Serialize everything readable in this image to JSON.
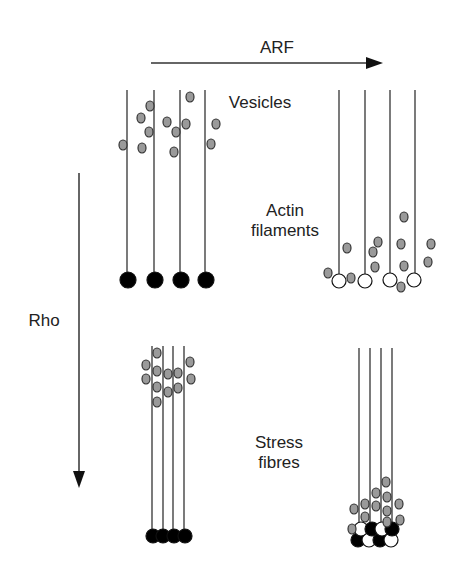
{
  "labels": {
    "arf": "ARF",
    "rho": "Rho",
    "vesicles": "Vesicles",
    "actin_line1": "Actin",
    "actin_line2": "filaments",
    "stress_line1": "Stress",
    "stress_line2": "fibres"
  },
  "colors": {
    "line": "#333333",
    "vesicle_fill": "#9a9a9a",
    "vesicle_stroke": "#333333",
    "ball_black": "#000000",
    "ball_white": "#ffffff",
    "text": "#222222"
  },
  "arrows": {
    "arf": {
      "x1": 151,
      "y1": 63,
      "x2": 383,
      "y2": 63,
      "direction": "right"
    },
    "rho": {
      "x1": 79,
      "y1": 173,
      "x2": 79,
      "y2": 488,
      "direction": "down"
    }
  },
  "panels": [
    {
      "id": "top-left",
      "description": "Actin filaments with black anchor balls, scattered vesicles near top",
      "filaments": [
        {
          "x": 127,
          "y1": 90,
          "y2": 280
        },
        {
          "x": 154,
          "y1": 90,
          "y2": 280
        },
        {
          "x": 180,
          "y1": 90,
          "y2": 280
        },
        {
          "x": 205,
          "y1": 90,
          "y2": 280
        }
      ],
      "balls": [
        {
          "x": 128,
          "y": 280,
          "r": 8,
          "fill": "black"
        },
        {
          "x": 155,
          "y": 280,
          "r": 8,
          "fill": "black"
        },
        {
          "x": 181,
          "y": 280,
          "r": 8,
          "fill": "black"
        },
        {
          "x": 206,
          "y": 280,
          "r": 8,
          "fill": "black"
        }
      ],
      "vesicles": [
        [
          123,
          145
        ],
        [
          141,
          118
        ],
        [
          150,
          106
        ],
        [
          149,
          132
        ],
        [
          142,
          148
        ],
        [
          167,
          122
        ],
        [
          176,
          132
        ],
        [
          174,
          152
        ],
        [
          186,
          124
        ],
        [
          190,
          97
        ],
        [
          216,
          124
        ],
        [
          211,
          144
        ]
      ]
    },
    {
      "id": "top-right",
      "description": "After ARF: white anchor balls, vesicles moved toward filament base",
      "filaments": [
        {
          "x": 339,
          "y1": 90,
          "y2": 274
        },
        {
          "x": 365,
          "y1": 90,
          "y2": 274
        },
        {
          "x": 390,
          "y1": 90,
          "y2": 273
        },
        {
          "x": 415,
          "y1": 90,
          "y2": 273
        }
      ],
      "balls": [
        {
          "x": 339,
          "y": 281,
          "r": 7,
          "fill": "white"
        },
        {
          "x": 365,
          "y": 281,
          "r": 7,
          "fill": "white"
        },
        {
          "x": 390,
          "y": 280,
          "r": 7,
          "fill": "white"
        },
        {
          "x": 414,
          "y": 280,
          "r": 7,
          "fill": "white"
        }
      ],
      "vesicles": [
        [
          328,
          273
        ],
        [
          347,
          248
        ],
        [
          351,
          278
        ],
        [
          378,
          242
        ],
        [
          373,
          252
        ],
        [
          375,
          267
        ],
        [
          404,
          217
        ],
        [
          401,
          244
        ],
        [
          404,
          266
        ],
        [
          401,
          287
        ],
        [
          431,
          244
        ],
        [
          428,
          262
        ]
      ]
    },
    {
      "id": "bottom-left",
      "description": "After Rho: bundled stress fibres with black balls, vesicles clustered at top",
      "filaments": [
        {
          "x": 152,
          "y1": 346,
          "y2": 536
        },
        {
          "x": 163,
          "y1": 346,
          "y2": 536
        },
        {
          "x": 173,
          "y1": 346,
          "y2": 536
        },
        {
          "x": 184,
          "y1": 346,
          "y2": 536
        }
      ],
      "balls": [
        {
          "x": 153,
          "y": 536,
          "r": 7,
          "fill": "black"
        },
        {
          "x": 163,
          "y": 536,
          "r": 7,
          "fill": "black"
        },
        {
          "x": 174,
          "y": 536,
          "r": 7,
          "fill": "black"
        },
        {
          "x": 185,
          "y": 536,
          "r": 7,
          "fill": "black"
        }
      ],
      "vesicles": [
        [
          157,
          353
        ],
        [
          146,
          365
        ],
        [
          146,
          379
        ],
        [
          157,
          371
        ],
        [
          157,
          387
        ],
        [
          157,
          402
        ],
        [
          168,
          374
        ],
        [
          168,
          392
        ],
        [
          178,
          373
        ],
        [
          178,
          388
        ],
        [
          190,
          362
        ],
        [
          191,
          379
        ]
      ]
    },
    {
      "id": "bottom-right",
      "description": "ARF + Rho: bundled stress fibres with mixed black/white balls, vesicles clustered at base",
      "filaments": [
        {
          "x": 359,
          "y1": 348,
          "y2": 528
        },
        {
          "x": 370,
          "y1": 348,
          "y2": 528
        },
        {
          "x": 381,
          "y1": 348,
          "y2": 528
        },
        {
          "x": 392,
          "y1": 348,
          "y2": 528
        }
      ],
      "balls": [
        {
          "x": 358,
          "y": 540,
          "r": 7,
          "fill": "black"
        },
        {
          "x": 369,
          "y": 540,
          "r": 7,
          "fill": "white"
        },
        {
          "x": 380,
          "y": 540,
          "r": 7,
          "fill": "black"
        },
        {
          "x": 391,
          "y": 540,
          "r": 7,
          "fill": "white"
        },
        {
          "x": 361,
          "y": 529,
          "r": 7,
          "fill": "white"
        },
        {
          "x": 372,
          "y": 529,
          "r": 7,
          "fill": "black"
        },
        {
          "x": 382,
          "y": 529,
          "r": 7,
          "fill": "white"
        },
        {
          "x": 392,
          "y": 529,
          "r": 7,
          "fill": "black"
        }
      ],
      "vesicles": [
        [
          386,
          482
        ],
        [
          376,
          493
        ],
        [
          387,
          497
        ],
        [
          365,
          504
        ],
        [
          376,
          506
        ],
        [
          387,
          511
        ],
        [
          354,
          509
        ],
        [
          399,
          504
        ],
        [
          365,
          517
        ],
        [
          387,
          522
        ],
        [
          400,
          520
        ],
        [
          352,
          529
        ]
      ]
    }
  ]
}
